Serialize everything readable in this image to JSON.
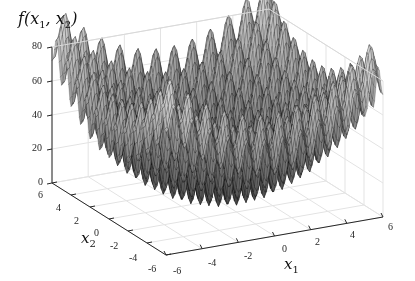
{
  "chart_data": {
    "type": "surface",
    "title": "f(x1, x2)",
    "title_parts": {
      "f": "f",
      "open": "(",
      "x": "x",
      "s1": "1",
      "comma": ", ",
      "s2": "2",
      "close": ")"
    },
    "function": "20 + x1^2 + x2^2 - 10*(cos(2*pi*x1) + cos(2*pi*x2))",
    "xlabel": "x1",
    "xlabel_parts": {
      "base": "x",
      "sub": "1"
    },
    "ylabel": "x2",
    "ylabel_parts": {
      "base": "x",
      "sub": "2"
    },
    "zlabel": "f(x1, x2)",
    "xlim": [
      -6,
      6
    ],
    "ylim": [
      -6,
      6
    ],
    "zlim": [
      0,
      80
    ],
    "x_ticks": [
      "-6",
      "-4",
      "-2",
      "0",
      "2",
      "4",
      "6"
    ],
    "y_ticks": [
      "6",
      "4",
      "2",
      "0",
      "-2",
      "-4",
      "-6"
    ],
    "z_ticks": [
      "0",
      "20",
      "40",
      "60",
      "80"
    ],
    "grid": true,
    "colormap": "gray",
    "edge_color": "#000000",
    "background": "#ffffff"
  }
}
